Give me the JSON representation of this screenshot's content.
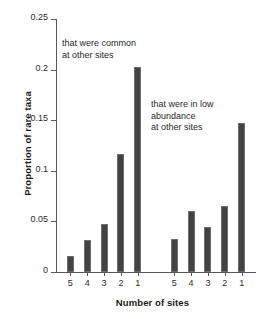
{
  "chart_data": {
    "type": "bar",
    "title": "",
    "xlabel": "Number of sites",
    "ylabel": "Proportion of rare taxa",
    "ylim": [
      0,
      0.25
    ],
    "yticks": [
      "0",
      "0.05",
      "0.1",
      "0.15",
      "0.2",
      "0.25"
    ],
    "ytick_values": [
      0,
      0.05,
      0.1,
      0.15,
      0.2,
      0.25
    ],
    "grid": false,
    "legend_position": "none",
    "groups": [
      {
        "name": "that were common at other sites",
        "categories": [
          "5",
          "4",
          "3",
          "2",
          "1"
        ],
        "values": [
          0.016,
          0.032,
          0.047,
          0.117,
          0.203
        ]
      },
      {
        "name": "that were in low abundance at other sites",
        "categories": [
          "5",
          "4",
          "3",
          "2",
          "1"
        ],
        "values": [
          0.033,
          0.06,
          0.044,
          0.065,
          0.147
        ]
      }
    ],
    "annotations": [
      {
        "id": "note-common",
        "text": "that were common\nat other sites"
      },
      {
        "id": "note-lowabundance",
        "text": "that were in low\nabundance\nat other sites"
      }
    ],
    "colors": {
      "bar_fill": "#434343",
      "bar_edge": "#6d6d6d",
      "axis": "#58585a",
      "text": "#1f1f1f",
      "background": "#ffffff"
    }
  }
}
